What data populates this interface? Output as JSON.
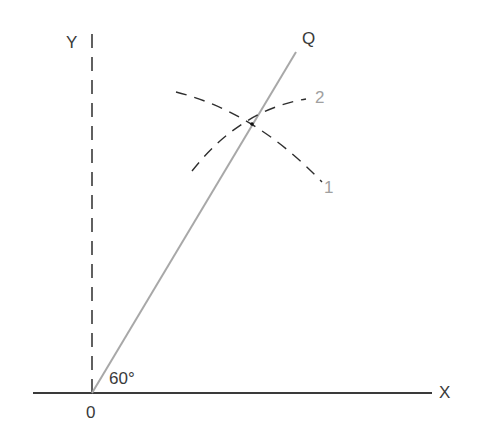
{
  "diagram": {
    "labels": {
      "y_axis": "Y",
      "x_axis": "X",
      "origin": "0",
      "ray": "Q",
      "angle": "60°",
      "arc1": "1",
      "arc2": "2"
    },
    "colors": {
      "axis": "#3a3a3a",
      "ray": "#a8a8a8",
      "arc": "#2e2e2e",
      "arc_label": "#a0a0a0"
    },
    "geometry": {
      "origin": [
        92,
        393
      ],
      "x_axis_end": [
        432,
        393
      ],
      "y_axis_end": [
        92,
        35
      ],
      "ray_end": [
        296,
        52
      ],
      "intersection": [
        252,
        124
      ],
      "angle_deg": 60
    }
  }
}
